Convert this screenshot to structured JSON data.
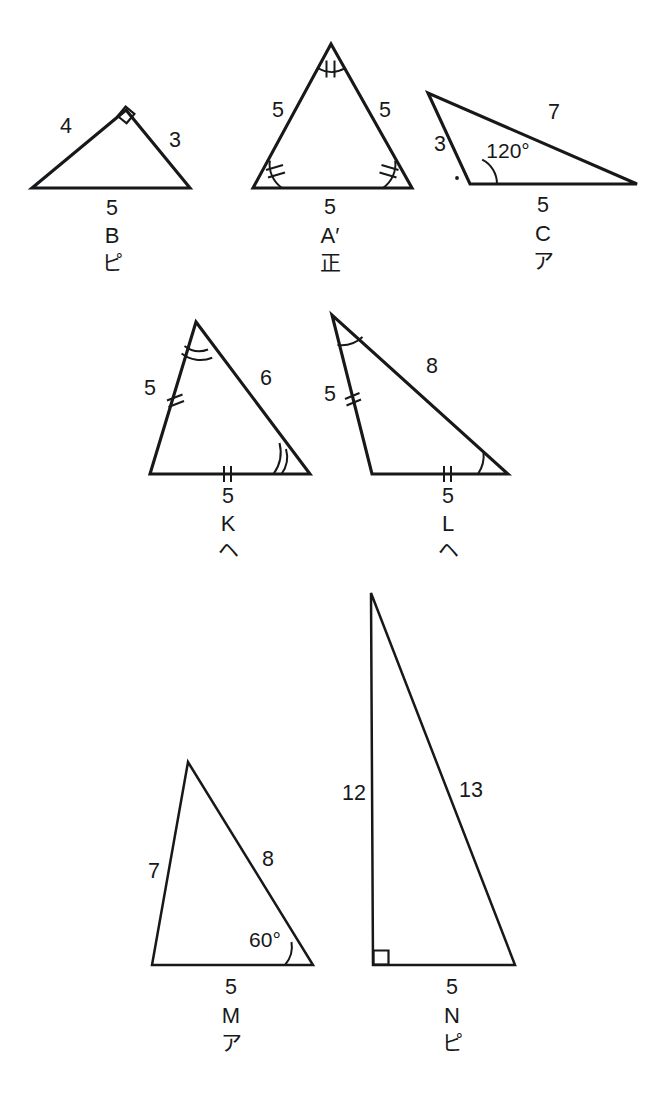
{
  "page": {
    "background_color": "#ffffff",
    "ink_color": "#17181a",
    "width": 656,
    "height": 1106
  },
  "figures": [
    {
      "id": "triangle-b",
      "name": "B",
      "kana": "ピ",
      "kind": "right",
      "side_left": "4",
      "side_right": "3",
      "side_base": "5",
      "angle": "",
      "marks": "right-angle-square-at-apex"
    },
    {
      "id": "triangle-a-prime",
      "name": "A′",
      "kana": "正",
      "kind": "equilateral",
      "side_left": "5",
      "side_right": "5",
      "side_base": "5",
      "angle": "",
      "marks": "double-tick-angle-marks-all-vertices"
    },
    {
      "id": "triangle-c",
      "name": "C",
      "kana": "ア",
      "kind": "obtuse",
      "side_left": "3",
      "side_right": "7",
      "side_base": "5",
      "angle": "120°",
      "marks": "angle-arc-and-dot"
    },
    {
      "id": "triangle-k",
      "name": "K",
      "kana": "ヘ",
      "kind": "isosceles",
      "side_left": "5",
      "side_right": "6",
      "side_base": "5",
      "angle": "",
      "marks": "double-tick-sides-double-arc-angles"
    },
    {
      "id": "triangle-l",
      "name": "L",
      "kana": "ヘ",
      "kind": "isosceles",
      "side_left": "5",
      "side_right": "8",
      "side_base": "5",
      "angle": "",
      "marks": "double-tick-sides-single-arc-angles"
    },
    {
      "id": "triangle-m",
      "name": "M",
      "kana": "ア",
      "kind": "scalene",
      "side_left": "7",
      "side_right": "8",
      "side_base": "5",
      "angle": "60°",
      "marks": "angle-arc-bottom-right"
    },
    {
      "id": "triangle-n",
      "name": "N",
      "kana": "ピ",
      "kind": "right",
      "side_left": "12",
      "side_right": "13",
      "side_base": "5",
      "angle": "",
      "marks": "right-angle-square-bottom-left"
    }
  ]
}
